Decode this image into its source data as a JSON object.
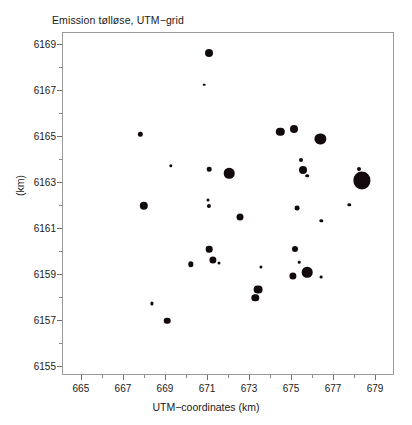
{
  "chart_data": {
    "type": "scatter",
    "title": "Emission tølløse, UTM−grid",
    "xlabel": "UTM−coordinates (km)",
    "ylabel": "(km)",
    "xlim": [
      664.1,
      679.9
    ],
    "ylim": [
      6154.6,
      6169.5
    ],
    "xticks": [
      665,
      667,
      669,
      671,
      673,
      675,
      677,
      679
    ],
    "xtick_labels": [
      "665",
      "667",
      "669",
      "671",
      "673",
      "675",
      "677",
      "679"
    ],
    "yticks": [
      6155,
      6157,
      6159,
      6161,
      6163,
      6165,
      6167,
      6169
    ],
    "ytick_labels": [
      "6155",
      "6157",
      "6159",
      "6161",
      "6163",
      "6165",
      "6167",
      "6169"
    ],
    "xminor_step": 1,
    "yminor_step": 1,
    "grid": false,
    "legend": null,
    "marker_color": "#120a0c",
    "marker_shape": "circle",
    "size_encoding": "bubble-radius-proportional-to-emission",
    "points": [
      {
        "x": 671.05,
        "y": 6168.65,
        "r": 4.0
      },
      {
        "x": 670.83,
        "y": 6167.25,
        "r": 1.3
      },
      {
        "x": 674.45,
        "y": 6165.2,
        "r": 4.2
      },
      {
        "x": 675.1,
        "y": 6165.35,
        "r": 4.0
      },
      {
        "x": 667.78,
        "y": 6165.1,
        "r": 2.2
      },
      {
        "x": 676.35,
        "y": 6164.9,
        "r": 5.6
      },
      {
        "x": 675.42,
        "y": 6164.0,
        "r": 2.0
      },
      {
        "x": 669.22,
        "y": 6163.72,
        "r": 1.7
      },
      {
        "x": 671.05,
        "y": 6163.58,
        "r": 2.3
      },
      {
        "x": 672.0,
        "y": 6163.4,
        "r": 5.3
      },
      {
        "x": 675.5,
        "y": 6163.55,
        "r": 4.0
      },
      {
        "x": 675.72,
        "y": 6163.3,
        "r": 1.8
      },
      {
        "x": 678.2,
        "y": 6163.6,
        "r": 2.0
      },
      {
        "x": 678.33,
        "y": 6163.1,
        "r": 8.6
      },
      {
        "x": 670.98,
        "y": 6162.25,
        "r": 1.5
      },
      {
        "x": 671.05,
        "y": 6162.0,
        "r": 2.1
      },
      {
        "x": 667.95,
        "y": 6162.0,
        "r": 4.2
      },
      {
        "x": 677.72,
        "y": 6162.05,
        "r": 1.7
      },
      {
        "x": 675.25,
        "y": 6161.9,
        "r": 2.4
      },
      {
        "x": 672.5,
        "y": 6161.5,
        "r": 3.5
      },
      {
        "x": 676.4,
        "y": 6161.35,
        "r": 1.7
      },
      {
        "x": 671.05,
        "y": 6160.1,
        "r": 3.3
      },
      {
        "x": 675.15,
        "y": 6160.1,
        "r": 3.0
      },
      {
        "x": 671.25,
        "y": 6159.65,
        "r": 3.6
      },
      {
        "x": 671.52,
        "y": 6159.5,
        "r": 1.5
      },
      {
        "x": 670.18,
        "y": 6159.45,
        "r": 2.7
      },
      {
        "x": 675.35,
        "y": 6159.55,
        "r": 1.3
      },
      {
        "x": 673.52,
        "y": 6159.35,
        "r": 1.6
      },
      {
        "x": 675.72,
        "y": 6159.1,
        "r": 5.3
      },
      {
        "x": 675.05,
        "y": 6158.95,
        "r": 3.6
      },
      {
        "x": 676.38,
        "y": 6158.9,
        "r": 1.4
      },
      {
        "x": 673.4,
        "y": 6158.35,
        "r": 4.4
      },
      {
        "x": 673.25,
        "y": 6158.0,
        "r": 3.7
      },
      {
        "x": 668.35,
        "y": 6157.75,
        "r": 1.6
      },
      {
        "x": 669.05,
        "y": 6157.0,
        "r": 3.3
      }
    ]
  }
}
